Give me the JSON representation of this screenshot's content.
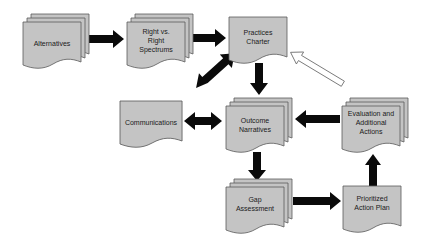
{
  "diagram": {
    "colors": {
      "node_fill": "#c4c4c4",
      "node_stroke": "#5a5a5a",
      "arrow": "#0a0a0a",
      "hollow_arrow_fill": "#ffffff",
      "background": "#ffffff"
    },
    "nodes": [
      {
        "id": "alternatives",
        "type": "multi-document",
        "lines": [
          "Alternatives"
        ]
      },
      {
        "id": "right-vs-right",
        "type": "multi-document",
        "lines": [
          "Right vs.",
          "Right",
          "Spectrums"
        ]
      },
      {
        "id": "practices-charter",
        "type": "document",
        "lines": [
          "Practices",
          "Charter"
        ]
      },
      {
        "id": "communications",
        "type": "document",
        "lines": [
          "Communications"
        ]
      },
      {
        "id": "outcome-narratives",
        "type": "multi-document",
        "lines": [
          "Outcome",
          "Narratives"
        ]
      },
      {
        "id": "evaluation",
        "type": "multi-document",
        "lines": [
          "Evaluation and",
          "Additional",
          "Actions"
        ]
      },
      {
        "id": "gap-assessment",
        "type": "multi-document",
        "lines": [
          "Gap",
          "Assessment"
        ]
      },
      {
        "id": "prioritized-action-plan",
        "type": "document",
        "lines": [
          "Prioritized",
          "Action Plan"
        ]
      }
    ],
    "edges": [
      {
        "from": "alternatives",
        "to": "right-vs-right",
        "style": "solid"
      },
      {
        "from": "right-vs-right",
        "to": "practices-charter",
        "style": "solid"
      },
      {
        "from": "practices-charter",
        "to": "outcome-narratives",
        "style": "solid"
      },
      {
        "from": "practices-charter",
        "to": "communications",
        "style": "solid-bidirectional"
      },
      {
        "from": "communications",
        "to": "outcome-narratives",
        "style": "solid-bidirectional"
      },
      {
        "from": "evaluation",
        "to": "outcome-narratives",
        "style": "solid"
      },
      {
        "from": "outcome-narratives",
        "to": "gap-assessment",
        "style": "solid"
      },
      {
        "from": "gap-assessment",
        "to": "prioritized-action-plan",
        "style": "solid"
      },
      {
        "from": "prioritized-action-plan",
        "to": "evaluation",
        "style": "solid"
      },
      {
        "from": "evaluation",
        "to": "practices-charter",
        "style": "hollow"
      }
    ]
  }
}
